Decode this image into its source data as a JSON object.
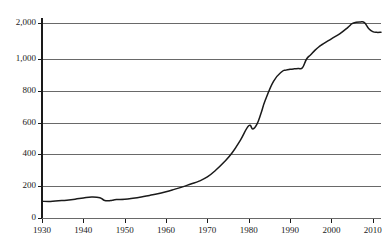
{
  "chart_data": {
    "type": "line",
    "title": "",
    "subtitle": "",
    "xlabel": "",
    "ylabel": "",
    "grid": true,
    "legend": null,
    "legend_position": "none",
    "xlim": [
      1930,
      2012
    ],
    "ylim": [
      0,
      2000
    ],
    "y_axis_note": "broken/compressed scale: linear 0-1000, compressed 1000-2000",
    "xticks": [
      1930,
      1940,
      1950,
      1960,
      1970,
      1980,
      1990,
      2000,
      2010
    ],
    "xtick_labels": [
      "1930",
      "1940",
      "1950",
      "1960",
      "1970",
      "1980",
      "1990",
      "2000",
      "2010"
    ],
    "yticks": [
      0,
      200,
      400,
      600,
      800,
      1000,
      2000
    ],
    "ytick_labels": [
      "0",
      "200",
      "400",
      "600",
      "800",
      "1,000",
      "2,000"
    ],
    "line_color": "#1a1a1a",
    "grid_color": "#595959",
    "axis_color": "#1a1a1a",
    "series": [
      {
        "name": "series-1",
        "x": [
          1930,
          1932,
          1934,
          1936,
          1938,
          1940,
          1942,
          1944,
          1945,
          1946,
          1947,
          1948,
          1950,
          1952,
          1954,
          1956,
          1958,
          1960,
          1962,
          1964,
          1966,
          1968,
          1970,
          1972,
          1974,
          1976,
          1978,
          1980,
          1981,
          1982,
          1983,
          1984,
          1986,
          1988,
          1989,
          1990,
          1991,
          1992,
          1993,
          1994,
          1995,
          1996,
          1997,
          1998,
          2000,
          2002,
          2004,
          2005,
          2006,
          2007,
          2008,
          2009,
          2010,
          2011,
          2012
        ],
        "values": [
          105,
          104,
          108,
          112,
          118,
          126,
          132,
          128,
          112,
          108,
          112,
          116,
          118,
          124,
          132,
          142,
          152,
          165,
          180,
          196,
          214,
          232,
          258,
          300,
          350,
          410,
          490,
          580,
          560,
          590,
          660,
          740,
          860,
          920,
          930,
          935,
          938,
          940,
          945,
          1000,
          1120,
          1240,
          1340,
          1420,
          1560,
          1700,
          1880,
          1980,
          2020,
          2030,
          2010,
          1850,
          1760,
          1740,
          1745
        ]
      }
    ]
  }
}
